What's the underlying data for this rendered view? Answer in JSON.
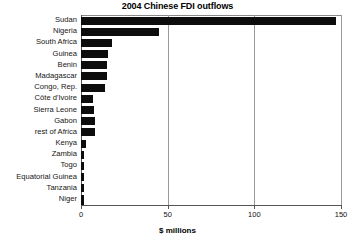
{
  "chart_data": {
    "type": "bar",
    "orientation": "horizontal",
    "title": "2004 Chinese FDI outflows",
    "xlabel": "$ millions",
    "ylabel": "",
    "xlim": [
      0,
      150
    ],
    "xticks": [
      0,
      50,
      100,
      150
    ],
    "xtick_labels": [
      "0",
      "50",
      "100",
      "150"
    ],
    "grid": "vertical",
    "legend": null,
    "categories": [
      "Sudan",
      "Nigeria",
      "South Africa",
      "Guinea",
      "Benin",
      "Madagascar",
      "Congo, Rep.",
      "Côte d'Ivoire",
      "Sierra Leone",
      "Gabon",
      "rest of Africa",
      "Kenya",
      "Zambia",
      "Togo",
      "Equatorial Guinea",
      "Tanzania",
      "Niger"
    ],
    "values": [
      147,
      45,
      18,
      15.5,
      15,
      15,
      14,
      7,
      7.5,
      8,
      8,
      3,
      2,
      2,
      2,
      2,
      2
    ],
    "units": "$ millions",
    "bar_color": "#0d0d0d",
    "background_color": "#ffffff",
    "grid_color": "#9a9a9a",
    "axis_color": "#555555"
  }
}
